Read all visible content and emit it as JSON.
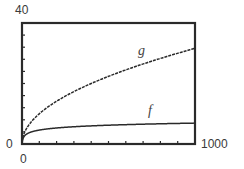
{
  "chart_data": {
    "type": "line",
    "title": "",
    "xlabel": "",
    "ylabel": "",
    "xlim": [
      0,
      1000
    ],
    "ylim": [
      0,
      40
    ],
    "x_tick_step": 100,
    "y_tick_step": 4,
    "grid": false,
    "legend": "none (curves labeled inline)",
    "axis_labels": {
      "x_min": "0",
      "x_max": "1000",
      "y_min": "0",
      "y_max": "40"
    },
    "series": [
      {
        "name": "g",
        "formula": "sqrt(x)",
        "x": [
          0,
          1,
          10,
          50,
          100,
          200,
          300,
          400,
          500,
          600,
          700,
          800,
          900,
          1000
        ],
        "values": [
          0,
          1,
          3.16,
          7.07,
          10,
          14.14,
          17.32,
          20,
          22.36,
          24.49,
          26.46,
          28.28,
          30,
          31.62
        ]
      },
      {
        "name": "f",
        "formula": "ln(x)",
        "x": [
          1,
          10,
          50,
          100,
          200,
          300,
          400,
          500,
          600,
          700,
          800,
          900,
          1000
        ],
        "values": [
          0,
          2.3,
          3.91,
          4.61,
          5.3,
          5.7,
          5.99,
          6.21,
          6.4,
          6.55,
          6.68,
          6.8,
          6.91
        ]
      }
    ],
    "annotations": [
      {
        "text": "g",
        "near_x": 680,
        "near_y": 33
      },
      {
        "text": "f",
        "near_x": 740,
        "near_y": 9
      }
    ]
  },
  "labels": {
    "y_max": "40",
    "y_min": "0",
    "x_min": "0",
    "x_max": "1000",
    "g": "g",
    "f": "f"
  }
}
